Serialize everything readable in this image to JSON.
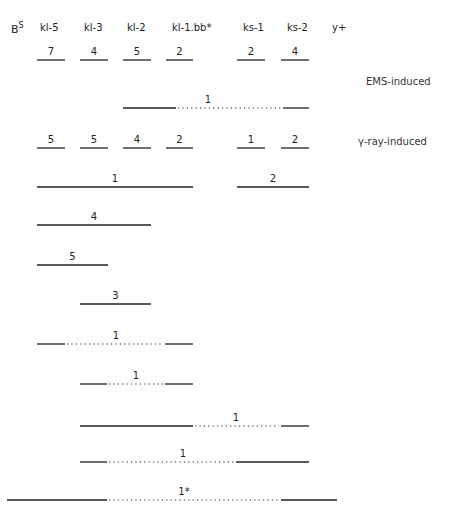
{
  "chart_data": {
    "type": "complementation-map",
    "title_gene": "B",
    "title_gene_superscript": "S",
    "columns": [
      "kl-5",
      "kl-3",
      "kl-2",
      "kl-1.bb*",
      "ks-1",
      "ks-2",
      "y+"
    ],
    "groups": [
      {
        "label": "EMS-induced",
        "rows": [
          {
            "segments": [
              {
                "from": "kl-5",
                "to": "kl-5",
                "count": "7",
                "style": "solid"
              },
              {
                "from": "kl-3",
                "to": "kl-3",
                "count": "4",
                "style": "solid"
              },
              {
                "from": "kl-2",
                "to": "kl-2",
                "count": "5",
                "style": "solid"
              },
              {
                "from": "kl-1.bb*",
                "to": "kl-1.bb*",
                "count": "2",
                "style": "solid"
              },
              {
                "from": "ks-1",
                "to": "ks-1",
                "count": "2",
                "style": "solid"
              },
              {
                "from": "ks-2",
                "to": "ks-2",
                "count": "4",
                "style": "solid"
              }
            ]
          },
          {
            "segments": [
              {
                "from": "kl-2",
                "to": "ks-2",
                "count": "1",
                "style": "solid-dotted-solid"
              }
            ]
          }
        ]
      },
      {
        "label": "γ-ray-induced",
        "rows": [
          {
            "segments": [
              {
                "from": "kl-5",
                "to": "kl-5",
                "count": "5",
                "style": "solid"
              },
              {
                "from": "kl-3",
                "to": "kl-3",
                "count": "5",
                "style": "solid"
              },
              {
                "from": "kl-2",
                "to": "kl-2",
                "count": "4",
                "style": "solid"
              },
              {
                "from": "kl-1.bb*",
                "to": "kl-1.bb*",
                "count": "2",
                "style": "solid"
              },
              {
                "from": "ks-1",
                "to": "ks-1",
                "count": "1",
                "style": "solid"
              },
              {
                "from": "ks-2",
                "to": "ks-2",
                "count": "2",
                "style": "solid"
              }
            ]
          },
          {
            "segments": [
              {
                "from": "kl-5",
                "to": "kl-1.bb*",
                "count": "1",
                "style": "solid"
              },
              {
                "from": "ks-1",
                "to": "ks-2",
                "count": "2",
                "style": "solid"
              }
            ]
          },
          {
            "segments": [
              {
                "from": "kl-5",
                "to": "kl-2",
                "count": "4",
                "style": "solid"
              }
            ]
          },
          {
            "segments": [
              {
                "from": "kl-5",
                "to": "kl-3",
                "count": "5",
                "style": "solid"
              }
            ]
          },
          {
            "segments": [
              {
                "from": "kl-3",
                "to": "kl-2",
                "count": "3",
                "style": "solid"
              }
            ]
          },
          {
            "segments": [
              {
                "from": "kl-5",
                "to": "kl-1.bb*",
                "count": "1",
                "style": "solid-dotted-solid"
              }
            ]
          },
          {
            "segments": [
              {
                "from": "kl-3",
                "to": "kl-1.bb*",
                "count": "1",
                "style": "solid-dotted-solid"
              }
            ]
          },
          {
            "segments": [
              {
                "from": "kl-3",
                "to": "ks-2",
                "count": "1",
                "style": "solid-dotted-solid"
              }
            ]
          },
          {
            "segments": [
              {
                "from": "kl-3",
                "to": "ks-2",
                "count": "1",
                "style": "solid-dotted-solid"
              }
            ]
          },
          {
            "segments": [
              {
                "from": "left-of-kl-5",
                "to": "right-of-ks-2",
                "count": "1*",
                "style": "solid-dotted-solid"
              }
            ]
          }
        ]
      }
    ]
  },
  "header": {
    "gene_base": "B",
    "gene_sup": "S",
    "columns": [
      "kl-5",
      "kl-3",
      "kl-2",
      "kl-1.bb*",
      "ks-1",
      "ks-2",
      "y+"
    ]
  },
  "side_labels": {
    "ems": "EMS-induced",
    "gamma": "γ-ray-induced"
  }
}
